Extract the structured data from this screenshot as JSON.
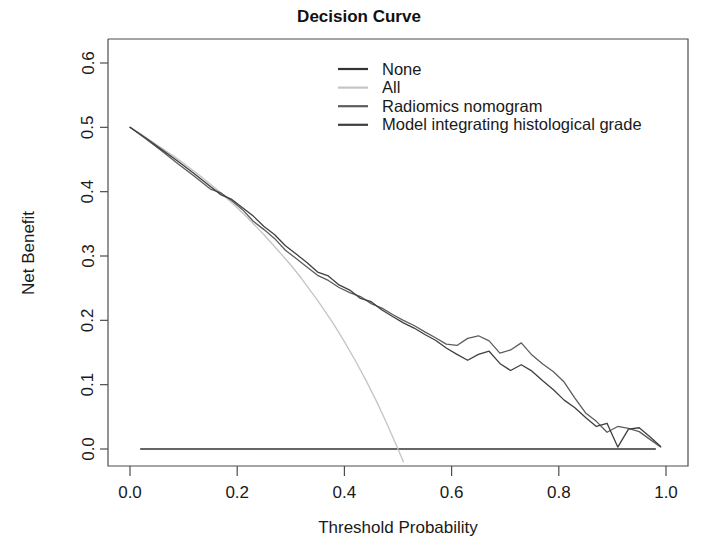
{
  "chart_data": {
    "type": "line",
    "title": "Decision Curve",
    "xlabel": "Threshold Probability",
    "ylabel": "Net Benefit",
    "xlim": [
      0.0,
      1.0
    ],
    "ylim": [
      0.0,
      0.6
    ],
    "grid": false,
    "legend_position": "top-center",
    "xticks": [
      "0.0",
      "0.2",
      "0.4",
      "0.6",
      "0.8",
      "1.0"
    ],
    "xtick_values": [
      0.0,
      0.2,
      0.4,
      0.6,
      0.8,
      1.0
    ],
    "yticks": [
      "0.0",
      "0.1",
      "0.2",
      "0.3",
      "0.4",
      "0.5",
      "0.6"
    ],
    "ytick_values": [
      0.0,
      0.1,
      0.2,
      0.3,
      0.4,
      0.5,
      0.6
    ],
    "series": [
      {
        "name": "None",
        "color": "#333333",
        "x": [
          0.02,
          0.98
        ],
        "values": [
          0.0,
          0.0
        ]
      },
      {
        "name": "All",
        "color": "#c4c4c4",
        "x": [
          0.0,
          0.02,
          0.05,
          0.08,
          0.1,
          0.13,
          0.16,
          0.18,
          0.2,
          0.22,
          0.25,
          0.28,
          0.3,
          0.32,
          0.35,
          0.38,
          0.4,
          0.42,
          0.44,
          0.46,
          0.48,
          0.5,
          0.51
        ],
        "values": [
          0.5,
          0.49,
          0.473,
          0.456,
          0.444,
          0.425,
          0.405,
          0.39,
          0.375,
          0.359,
          0.333,
          0.305,
          0.286,
          0.265,
          0.231,
          0.194,
          0.167,
          0.138,
          0.107,
          0.074,
          0.038,
          0.0,
          -0.02
        ]
      },
      {
        "name": "Radiomics nomogram",
        "color": "#5c5c5c",
        "x": [
          0.0,
          0.03,
          0.06,
          0.09,
          0.12,
          0.15,
          0.17,
          0.19,
          0.21,
          0.23,
          0.25,
          0.27,
          0.29,
          0.31,
          0.33,
          0.35,
          0.37,
          0.39,
          0.41,
          0.43,
          0.45,
          0.47,
          0.49,
          0.51,
          0.53,
          0.55,
          0.57,
          0.59,
          0.61,
          0.63,
          0.65,
          0.67,
          0.69,
          0.71,
          0.73,
          0.75,
          0.77,
          0.79,
          0.81,
          0.83,
          0.85,
          0.87,
          0.89,
          0.91,
          0.93,
          0.95,
          0.97,
          0.99
        ],
        "values": [
          0.5,
          0.482,
          0.463,
          0.443,
          0.424,
          0.404,
          0.398,
          0.386,
          0.372,
          0.354,
          0.341,
          0.327,
          0.309,
          0.296,
          0.283,
          0.27,
          0.262,
          0.251,
          0.243,
          0.237,
          0.226,
          0.219,
          0.209,
          0.2,
          0.192,
          0.182,
          0.173,
          0.163,
          0.161,
          0.172,
          0.176,
          0.168,
          0.149,
          0.154,
          0.165,
          0.146,
          0.132,
          0.12,
          0.104,
          0.079,
          0.056,
          0.043,
          0.026,
          0.035,
          0.032,
          0.027,
          0.015,
          0.003
        ]
      },
      {
        "name": "Model integrating histological grade",
        "color": "#3f3f3f",
        "x": [
          0.0,
          0.03,
          0.06,
          0.09,
          0.12,
          0.15,
          0.17,
          0.19,
          0.21,
          0.23,
          0.25,
          0.27,
          0.29,
          0.31,
          0.33,
          0.35,
          0.37,
          0.39,
          0.41,
          0.43,
          0.45,
          0.47,
          0.49,
          0.51,
          0.53,
          0.55,
          0.57,
          0.59,
          0.61,
          0.63,
          0.65,
          0.67,
          0.69,
          0.71,
          0.73,
          0.75,
          0.77,
          0.79,
          0.81,
          0.83,
          0.85,
          0.87,
          0.89,
          0.91,
          0.93,
          0.95,
          0.97,
          0.99
        ],
        "values": [
          0.5,
          0.483,
          0.465,
          0.447,
          0.428,
          0.408,
          0.395,
          0.388,
          0.375,
          0.362,
          0.346,
          0.333,
          0.316,
          0.303,
          0.29,
          0.275,
          0.269,
          0.255,
          0.247,
          0.234,
          0.229,
          0.216,
          0.206,
          0.196,
          0.188,
          0.178,
          0.169,
          0.157,
          0.147,
          0.138,
          0.147,
          0.152,
          0.133,
          0.122,
          0.131,
          0.121,
          0.106,
          0.092,
          0.076,
          0.064,
          0.049,
          0.035,
          0.04,
          0.003,
          0.031,
          0.033,
          0.019,
          0.004
        ]
      }
    ],
    "legend_entries": [
      {
        "label": "None",
        "color": "#333333"
      },
      {
        "label": "All",
        "color": "#c4c4c4"
      },
      {
        "label": "Radiomics nomogram",
        "color": "#5c5c5c"
      },
      {
        "label": "Model integrating histological grade",
        "color": "#3f3f3f"
      }
    ]
  }
}
